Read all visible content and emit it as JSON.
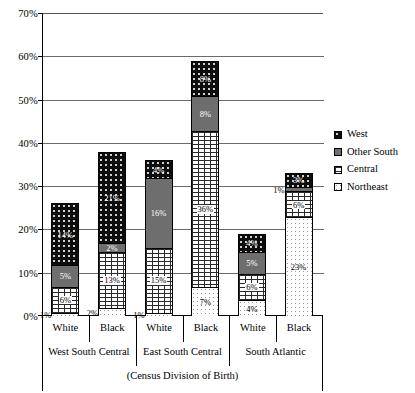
{
  "chart_data": {
    "type": "bar",
    "subtype": "stacked-bar",
    "title": "",
    "xlabel": "(Census Division of Birth)",
    "ylabel": "",
    "ylim": [
      0,
      70
    ],
    "ytick_labels": [
      "0%",
      "10%",
      "20%",
      "30%",
      "40%",
      "50%",
      "60%",
      "70%"
    ],
    "ytick_values": [
      0,
      10,
      20,
      30,
      40,
      50,
      60,
      70
    ],
    "grid": true,
    "legend_position": "right",
    "categories": [
      "White",
      "Black",
      "White",
      "Black",
      "White",
      "Black"
    ],
    "groups": [
      {
        "label": "West South Central",
        "categories": [
          "White",
          "Black"
        ]
      },
      {
        "label": "East South Central",
        "categories": [
          "White",
          "Black"
        ]
      },
      {
        "label": "South Atlantic",
        "categories": [
          "White",
          "Black"
        ]
      }
    ],
    "series": [
      {
        "name": "Northeast",
        "values": [
          1,
          2,
          1,
          7,
          4,
          23
        ]
      },
      {
        "name": "Central",
        "values": [
          6,
          13,
          15,
          36,
          6,
          6
        ]
      },
      {
        "name": "Other South",
        "values": [
          5,
          2,
          16,
          8,
          5,
          1
        ]
      },
      {
        "name": "West",
        "values": [
          14,
          21,
          4,
          8,
          4,
          3
        ]
      }
    ],
    "totals": [
      26,
      38,
      36,
      59,
      19,
      33
    ],
    "bars": [
      {
        "group": "West South Central",
        "category": "White",
        "segments": [
          {
            "series": "West",
            "value": 14,
            "label": "14%"
          },
          {
            "series": "Other South",
            "value": 5,
            "label": "5%"
          },
          {
            "series": "Central",
            "value": 6,
            "label": "6%"
          },
          {
            "series": "Northeast",
            "value": 1,
            "label": "1%",
            "label_outside": true
          }
        ]
      },
      {
        "group": "West South Central",
        "category": "Black",
        "segments": [
          {
            "series": "West",
            "value": 21,
            "label": "21%"
          },
          {
            "series": "Other South",
            "value": 2,
            "label": "2%"
          },
          {
            "series": "Central",
            "value": 13,
            "label": "13%"
          },
          {
            "series": "Northeast",
            "value": 2,
            "label": "2%",
            "label_outside": true
          }
        ]
      },
      {
        "group": "East South Central",
        "category": "White",
        "segments": [
          {
            "series": "West",
            "value": 4,
            "label": "4%"
          },
          {
            "series": "Other South",
            "value": 16,
            "label": "16%"
          },
          {
            "series": "Central",
            "value": 15,
            "label": "15%"
          },
          {
            "series": "Northeast",
            "value": 1,
            "label": "1%",
            "label_outside": true
          }
        ]
      },
      {
        "group": "East South Central",
        "category": "Black",
        "segments": [
          {
            "series": "West",
            "value": 8,
            "label": "8%"
          },
          {
            "series": "Other South",
            "value": 8,
            "label": "8%"
          },
          {
            "series": "Central",
            "value": 36,
            "label": "36%"
          },
          {
            "series": "Northeast",
            "value": 7,
            "label": "7%"
          }
        ]
      },
      {
        "group": "South Atlantic",
        "category": "White",
        "segments": [
          {
            "series": "West",
            "value": 4,
            "label": "4%"
          },
          {
            "series": "Other South",
            "value": 5,
            "label": "5%"
          },
          {
            "series": "Central",
            "value": 6,
            "label": "6%"
          },
          {
            "series": "Northeast",
            "value": 4,
            "label": "4%"
          }
        ]
      },
      {
        "group": "South Atlantic",
        "category": "Black",
        "segments": [
          {
            "series": "West",
            "value": 3,
            "label": "3%"
          },
          {
            "series": "Other South",
            "value": 1,
            "label": "1%",
            "label_outside": true
          },
          {
            "series": "Central",
            "value": 6,
            "label": "6%"
          },
          {
            "series": "Northeast",
            "value": 23,
            "label": "23%"
          }
        ]
      }
    ]
  },
  "legend": {
    "items": [
      {
        "label": "West",
        "swatch": "west-swatch"
      },
      {
        "label": "Other South",
        "swatch": "other-south-swatch"
      },
      {
        "label": "Central",
        "swatch": "central-swatch"
      },
      {
        "label": "Northeast",
        "swatch": "northeast-swatch"
      }
    ]
  },
  "axes": {
    "y_ticks": [
      "70%",
      "60%",
      "50%",
      "40%",
      "30%",
      "20%",
      "10%",
      "0%"
    ],
    "x_categories": [
      "White",
      "Black",
      "White",
      "Black",
      "White",
      "Black"
    ],
    "x_groups": [
      "West South Central",
      "East South Central",
      "South Atlantic"
    ],
    "x_caption": "(Census Division of Birth)"
  }
}
